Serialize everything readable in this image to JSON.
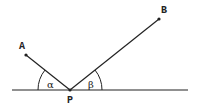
{
  "diagram": {
    "title": "",
    "points": {
      "A": {
        "label": "A",
        "x": 26,
        "y": 55,
        "label_x": 21,
        "label_y": 49
      },
      "B": {
        "label": "B",
        "x": 159,
        "y": 19,
        "label_x": 162,
        "label_y": 13
      },
      "P": {
        "label": "P",
        "x": 70,
        "y": 90,
        "label_x": 67,
        "label_y": 103
      }
    },
    "baseline": {
      "x1": 12,
      "x2": 188,
      "y": 90
    },
    "angles": {
      "alpha": {
        "label": "α",
        "label_x": 47,
        "label_y": 88,
        "radius": 32
      },
      "beta": {
        "label": "β",
        "label_x": 88,
        "label_y": 88,
        "radius": 32
      }
    },
    "colors": {
      "stroke": "#222222",
      "background": "#ffffff"
    }
  }
}
